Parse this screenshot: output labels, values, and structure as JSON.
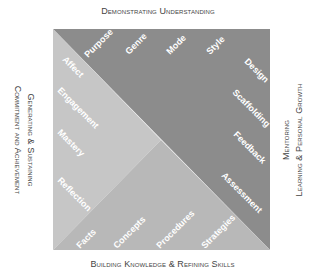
{
  "axes": {
    "top": [
      "Demonstrating Understanding"
    ],
    "bottom": [
      "Building Knowledge & Refining Skills"
    ],
    "left": [
      "Generating & Sustaining",
      "Commitment and Achievement"
    ],
    "right": [
      "Mentoring",
      "Learning & Personal Growth"
    ]
  },
  "regions": {
    "upper_right": {
      "color": "#8c8c8c",
      "labels_top": [
        "Purpose",
        "Genre",
        "Mode",
        "Style"
      ],
      "labels_right": [
        "Design",
        "Scaffolding",
        "Feedback",
        "Assessment"
      ]
    },
    "left": {
      "color": "#c6c6c6",
      "labels": [
        "Affect",
        "Engagement",
        "Mastery",
        "Reflection"
      ]
    },
    "bottom": {
      "color": "#b8b8b8",
      "labels": [
        "Facts",
        "Concepts",
        "Procedures",
        "Strategies"
      ]
    }
  }
}
